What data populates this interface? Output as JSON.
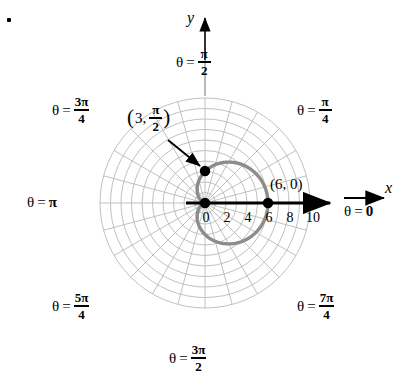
{
  "figure": {
    "type": "polar-graph",
    "bullet_marker": "•",
    "axes": {
      "x_letter": "x",
      "y_letter": "y"
    },
    "tick_labels": [
      "0",
      "2",
      "4",
      "6",
      "8",
      "10"
    ],
    "angle_labels": [
      {
        "name": "theta-0",
        "theta": "θ",
        "eq": "=",
        "value": "0",
        "kind": "plain"
      },
      {
        "name": "theta-pi-4",
        "theta": "θ",
        "eq": "=",
        "num": "π",
        "den": "4",
        "kind": "fraction"
      },
      {
        "name": "theta-pi-2",
        "theta": "θ",
        "eq": "=",
        "num": "π",
        "den": "2",
        "kind": "fraction"
      },
      {
        "name": "theta-3pi-4",
        "theta": "θ",
        "eq": "=",
        "num": "3π",
        "den": "4",
        "kind": "fraction"
      },
      {
        "name": "theta-pi",
        "theta": "θ",
        "eq": "=",
        "value": "π",
        "kind": "plain"
      },
      {
        "name": "theta-5pi-4",
        "theta": "θ",
        "eq": "=",
        "num": "5π",
        "den": "4",
        "kind": "fraction"
      },
      {
        "name": "theta-3pi-2",
        "theta": "θ",
        "eq": "=",
        "num": "3π",
        "den": "2",
        "kind": "fraction"
      },
      {
        "name": "theta-7pi-4",
        "theta": "θ",
        "eq": "=",
        "num": "7π",
        "den": "4",
        "kind": "fraction"
      }
    ],
    "point_labels": {
      "polar_point": {
        "open_paren": "(",
        "r": "3,",
        "num": "π",
        "den": "2",
        "close_paren": ")"
      },
      "cartesian_point": "(6, 0)"
    },
    "colors": {
      "curve": "#8c8c8c",
      "grid": "#b7b7b7",
      "axis": "#000000",
      "point": "#000000",
      "background": "#ffffff"
    }
  },
  "chart_data": {
    "type": "line",
    "plot_kind": "polar",
    "title": "",
    "xlabel": "x",
    "ylabel": "y",
    "equation": "r = 3(1 + cos θ)",
    "curve_name": "cardioid",
    "radial_ticks": [
      0,
      2,
      4,
      6,
      8,
      10
    ],
    "radial_gridline_radii": [
      1,
      2,
      3,
      4,
      5,
      6,
      7,
      8,
      9,
      10
    ],
    "angular_gridlines_deg": [
      0,
      15,
      30,
      45,
      60,
      75,
      90,
      105,
      120,
      135,
      150,
      165,
      180,
      195,
      210,
      225,
      240,
      255,
      270,
      285,
      300,
      315,
      330,
      345
    ],
    "angular_labels_deg": [
      0,
      45,
      90,
      135,
      180,
      225,
      270,
      315
    ],
    "rlim": [
      0,
      10
    ],
    "grid": true,
    "legend": "none",
    "annotations": [
      {
        "text": "(3, π/2)",
        "r": 3,
        "theta_deg": 90,
        "has_arrow": true
      },
      {
        "text": "(6, 0)",
        "r": 6,
        "theta_deg": 0,
        "has_arrow": false
      }
    ],
    "marked_points": [
      {
        "label": "(3, π/2)",
        "r": 3,
        "theta_deg": 90,
        "x": 0,
        "y": 3
      },
      {
        "label": "(6, 0)",
        "r": 6,
        "theta_deg": 0,
        "x": 6,
        "y": 0
      },
      {
        "label": "origin cusp",
        "r": 0,
        "theta_deg": 180,
        "x": 0,
        "y": 0
      }
    ],
    "series": [
      {
        "name": "r = 3(1 + cos θ)",
        "theta_deg": [
          0,
          15,
          30,
          45,
          60,
          75,
          90,
          105,
          120,
          135,
          150,
          165,
          180,
          195,
          210,
          225,
          240,
          255,
          270,
          285,
          300,
          315,
          330,
          345,
          360
        ],
        "r": [
          6.0,
          5.9,
          5.6,
          5.12,
          4.5,
          3.78,
          3.0,
          2.22,
          1.5,
          0.88,
          0.4,
          0.1,
          0.0,
          0.1,
          0.4,
          0.88,
          1.5,
          2.22,
          3.0,
          3.78,
          4.5,
          5.12,
          5.6,
          5.9,
          6.0
        ]
      }
    ]
  }
}
